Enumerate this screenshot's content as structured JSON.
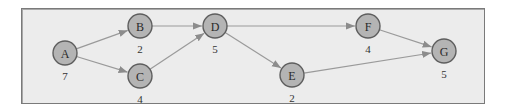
{
  "diagram": {
    "type": "directed-graph",
    "colors": {
      "background": "#ececec",
      "frame_border": "#7a7a7a",
      "node_fill": "#b4b4b4",
      "node_stroke": "#5e5e5e",
      "edge": "#9a9a9a"
    },
    "nodes": [
      {
        "id": "A",
        "label": "A",
        "weight": "7",
        "x": 65,
        "y": 53
      },
      {
        "id": "B",
        "label": "B",
        "weight": "2",
        "x": 140,
        "y": 26
      },
      {
        "id": "C",
        "label": "C",
        "weight": "4",
        "x": 140,
        "y": 76
      },
      {
        "id": "D",
        "label": "D",
        "weight": "5",
        "x": 215,
        "y": 26
      },
      {
        "id": "E",
        "label": "E",
        "weight": "2",
        "x": 292,
        "y": 75
      },
      {
        "id": "F",
        "label": "F",
        "weight": "4",
        "x": 368,
        "y": 26
      },
      {
        "id": "G",
        "label": "G",
        "weight": "5",
        "x": 444,
        "y": 51
      }
    ],
    "edges": [
      {
        "from": "A",
        "to": "B"
      },
      {
        "from": "A",
        "to": "C"
      },
      {
        "from": "B",
        "to": "D"
      },
      {
        "from": "C",
        "to": "D"
      },
      {
        "from": "D",
        "to": "F"
      },
      {
        "from": "D",
        "to": "E"
      },
      {
        "from": "F",
        "to": "G"
      },
      {
        "from": "E",
        "to": "G"
      }
    ]
  }
}
